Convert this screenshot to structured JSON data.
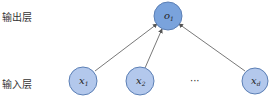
{
  "diagram": {
    "type": "single-layer neural network (linear regression)",
    "layers": [
      {
        "id": "output",
        "label": "输出层"
      },
      {
        "id": "input",
        "label": "输入层"
      }
    ],
    "nodes": [
      {
        "id": "o1",
        "layer": "output",
        "base": "o",
        "sub": "1",
        "cx": 168,
        "cy": 16
      },
      {
        "id": "x1",
        "layer": "input",
        "base": "x",
        "sub": "1",
        "cx": 83,
        "cy": 81
      },
      {
        "id": "x2",
        "layer": "input",
        "base": "x",
        "sub": "2",
        "cx": 140,
        "cy": 81
      },
      {
        "id": "xd",
        "layer": "input",
        "base": "x",
        "sub": "d",
        "cx": 255,
        "cy": 81
      }
    ],
    "ellipsis": "···",
    "edges": [
      {
        "from": "x1",
        "to": "o1"
      },
      {
        "from": "x2",
        "to": "o1"
      },
      {
        "from": "xd",
        "to": "o1"
      }
    ],
    "colors": {
      "output_fill": "#7aa3dc",
      "input_fill": "#b3c8ec",
      "node_stroke": "#5b7fb5",
      "edge": "#555555"
    }
  }
}
